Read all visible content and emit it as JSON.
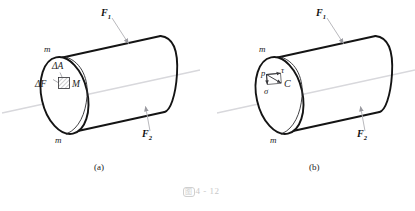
{
  "figure": {
    "caption_mark": "图",
    "caption_number": "4 - 12",
    "panels": [
      {
        "id": "a",
        "panel_label": "(a)",
        "section_labels": [
          "m",
          "m"
        ],
        "force_labels": [
          {
            "symbol": "F",
            "subscript": "1"
          },
          {
            "symbol": "F",
            "subscript": "2"
          }
        ],
        "annotations": [
          {
            "name": "delta-area",
            "text": "ΔA"
          },
          {
            "name": "delta-force",
            "text": "ΔF"
          },
          {
            "name": "point-m",
            "text": "M"
          }
        ]
      },
      {
        "id": "b",
        "panel_label": "(b)",
        "section_labels": [
          "m",
          "m"
        ],
        "force_labels": [
          {
            "symbol": "F",
            "subscript": "1"
          },
          {
            "symbol": "F",
            "subscript": "2"
          }
        ],
        "annotations": [
          {
            "name": "total-stress",
            "text": "p"
          },
          {
            "name": "shear-stress",
            "text": "τ"
          },
          {
            "name": "normal-stress",
            "text": "σ"
          },
          {
            "name": "point-c",
            "text": "C"
          }
        ]
      }
    ]
  },
  "colors": {
    "outline": "#141414",
    "axis_line": "#d8d8dc",
    "leader_line": "#b9b9bd",
    "hatch": "#6e6e72",
    "caption": "#c9c9c9",
    "background": "#ffffff"
  }
}
